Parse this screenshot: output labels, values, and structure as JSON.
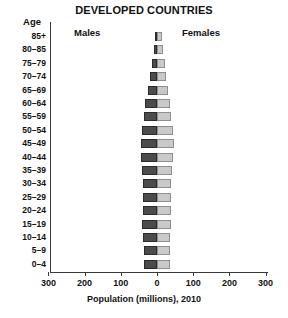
{
  "chart_data": {
    "type": "bar",
    "subtype": "population-pyramid",
    "title": "DEVELOPED COUNTRIES",
    "xlabel": "Population (millions), 2010",
    "ylabel": "Age",
    "xlim": [
      -300,
      300
    ],
    "xticks": [
      300,
      200,
      100,
      0,
      100,
      200,
      300
    ],
    "grid": false,
    "legend_position": "top-center",
    "categories": [
      "85+",
      "80–85",
      "75–79",
      "70–74",
      "65–69",
      "60–64",
      "55–59",
      "50–54",
      "45–49",
      "40–44",
      "35–39",
      "30–34",
      "25–29",
      "20–24",
      "15–19",
      "10–14",
      "5–9",
      "0–4"
    ],
    "series": [
      {
        "name": "Males",
        "color": "#4c4c4c",
        "values": [
          6,
          9,
          14,
          19,
          24,
          32,
          36,
          41,
          45,
          43,
          41,
          40,
          40,
          40,
          41,
          39,
          37,
          37
        ]
      },
      {
        "name": "Females",
        "color": "#c9c9c9",
        "values": [
          14,
          17,
          22,
          26,
          30,
          37,
          40,
          44,
          47,
          44,
          42,
          40,
          39,
          39,
          39,
          37,
          35,
          35
        ]
      }
    ]
  },
  "axis": {
    "tick_labels": [
      "300",
      "200",
      "100",
      "0",
      "100",
      "200",
      "300"
    ],
    "title": "Population (millions), 2010"
  },
  "legend": {
    "males_label": "Males",
    "females_label": "Females"
  },
  "header": {
    "title": "DEVELOPED COUNTRIES",
    "age_label": "Age"
  }
}
